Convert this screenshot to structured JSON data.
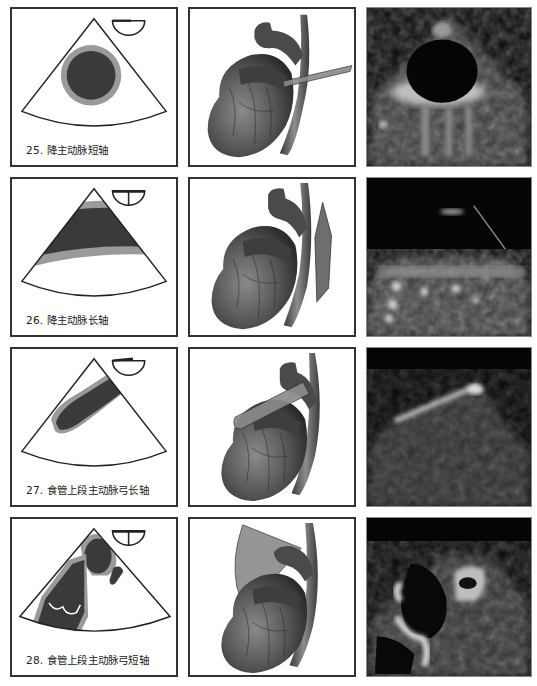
{
  "figure": {
    "layout": {
      "columns": 3,
      "rows": 4
    },
    "colors": {
      "vessel_lumen": "#3a3a3a",
      "vessel_wall": "#9a9a9a",
      "sector_outline": "#222222",
      "echo_background": "#050505",
      "scan_plane": "#8a8a8a"
    },
    "views": [
      {
        "number": "25",
        "caption": "25. 降主动脉短轴",
        "schematic_icon": "probe-orientation-semicircle-icon",
        "anatomy": "heart-with-horizontal-scan-plane",
        "echo": "descending-aorta-short-axis-echo"
      },
      {
        "number": "26",
        "caption": "26. 降主动脉长轴",
        "schematic_icon": "probe-orientation-split-icon",
        "anatomy": "heart-with-vertical-scan-plane",
        "echo": "descending-aorta-long-axis-echo"
      },
      {
        "number": "27",
        "caption": "27. 食管上段主动脉弓长轴",
        "schematic_icon": "probe-orientation-semicircle-icon",
        "anatomy": "heart-with-oblique-scan-plane",
        "echo": "upper-esophageal-aortic-arch-long-axis-echo"
      },
      {
        "number": "28",
        "caption": "28. 食管上段主动脉弓短轴",
        "schematic_icon": "probe-orientation-split-icon",
        "anatomy": "heart-with-fan-scan-plane",
        "echo": "upper-esophageal-aortic-arch-short-axis-echo"
      }
    ]
  }
}
